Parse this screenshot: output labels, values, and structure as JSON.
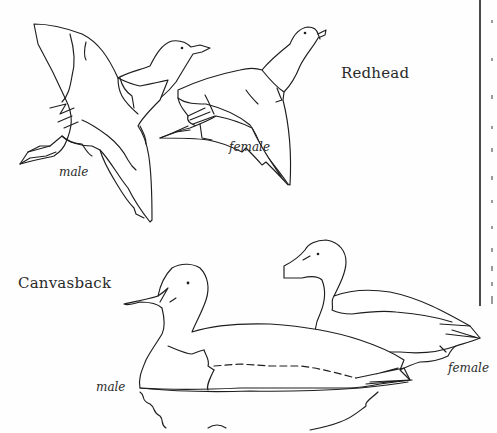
{
  "illustration": {
    "style": "black line drawing on white (coloring page)",
    "sections": [
      {
        "title": "Redhead",
        "pose": "flying",
        "birds": [
          {
            "label": "male"
          },
          {
            "label": "female"
          }
        ]
      },
      {
        "title": "Canvasback",
        "pose": "swimming",
        "birds": [
          {
            "label": "male"
          },
          {
            "label": "female"
          }
        ]
      }
    ]
  },
  "colors": {
    "ink": "#1e1e1e",
    "paper": "#fefefe",
    "separator": "#4a4a4a"
  }
}
